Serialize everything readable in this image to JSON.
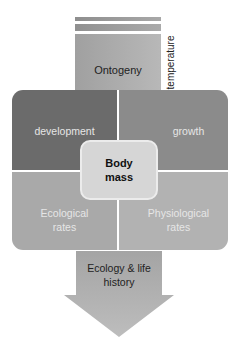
{
  "diagram": {
    "top": {
      "label": "Ontogeny",
      "side_label": "temperature"
    },
    "quadrants": {
      "top_left": {
        "label": "development",
        "color": "#6b6b6b"
      },
      "top_right": {
        "label": "growth",
        "color": "#8b8b8b"
      },
      "bottom_left": {
        "label_line1": "Ecological",
        "label_line2": "rates",
        "color": "#a9a9a9"
      },
      "bottom_right": {
        "label_line1": "Physiological",
        "label_line2": "rates",
        "color": "#b2b2b2"
      }
    },
    "center": {
      "label_line1": "Body",
      "label_line2": "mass"
    },
    "bottom_arrow": {
      "label_line1": "Ecology & life",
      "label_line2": "history"
    }
  }
}
